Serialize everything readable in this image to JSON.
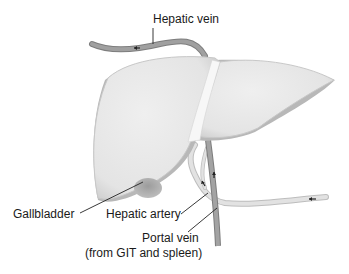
{
  "diagram": {
    "colors": {
      "liver_fill": "#ebebeb",
      "liver_shadow": "#b5b5b5",
      "vein": "#9a9a9a",
      "vein_edge": "#7d7d7d",
      "artery": "#dcdcdc",
      "gallbladder": "#a8a8a8",
      "leader_line": "#222222"
    },
    "labels": {
      "hepatic_vein": "Hepatic vein",
      "gallbladder": "Gallbladder",
      "hepatic_artery": "Hepatic artery",
      "portal_vein": "Portal vein",
      "portal_vein_note": "(from GIT and spleen)"
    },
    "flow_arrows": [
      {
        "vessel": "hepatic vein",
        "direction": "left"
      },
      {
        "vessel": "hepatic artery",
        "direction": "left"
      },
      {
        "vessel": "hepatic artery branch",
        "direction": "up"
      },
      {
        "vessel": "portal vein",
        "direction": "up"
      }
    ]
  }
}
